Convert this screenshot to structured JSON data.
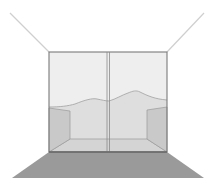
{
  "figure": {
    "colors": {
      "background": "#ffffff",
      "sky": "#eeeeee",
      "hills": "#dedede",
      "side_walls": "#c9c9c9",
      "room_floor": "#d6d6d6",
      "ground_plane": "#9a9a9a",
      "frame_stroke": "#7a7a7a",
      "perspective_lines": "#cfcfcf"
    }
  }
}
